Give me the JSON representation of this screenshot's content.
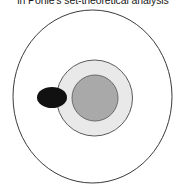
{
  "figure": {
    "caption": "in Pohle's set-theoretical analysis",
    "background_color": "#ffffff",
    "diagram_type": "nested-set-venn-diagram"
  },
  "shapes": {
    "outer_circle": {
      "label": "outer-set",
      "fill": "#ffffff",
      "stroke": "#3a3a3a",
      "stroke_width": 1,
      "cx": 92.5,
      "cy": 96.5,
      "rx": 79.5,
      "ry": 86.5
    },
    "middle_circle": {
      "label": "middle-set",
      "fill": "#e9e9e9",
      "stroke": "#5a5a5a",
      "stroke_width": 1,
      "cx": 94.5,
      "cy": 98,
      "rx": 38,
      "ry": 38
    },
    "inner_circle": {
      "label": "inner-set",
      "fill": "#a9a9a9",
      "stroke": "#6a6a6a",
      "stroke_width": 1,
      "cx": 95,
      "cy": 98,
      "rx": 23,
      "ry": 23
    },
    "black_ellipse": {
      "label": "overlapping-element",
      "fill": "#111111",
      "stroke": "#111111",
      "stroke_width": 0,
      "cx": 52,
      "cy": 97.5,
      "rx": 15,
      "ry": 10.5
    }
  }
}
